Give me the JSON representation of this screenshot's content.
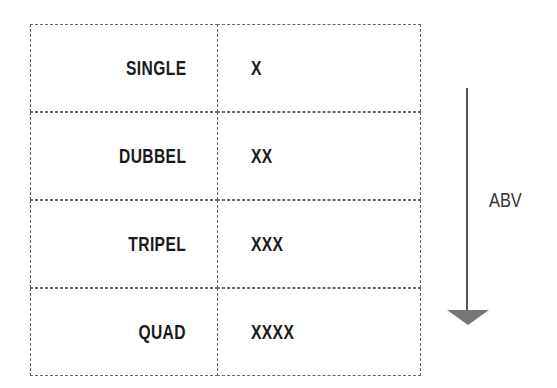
{
  "table": {
    "rows": [
      {
        "style": "SINGLE",
        "marks": "X"
      },
      {
        "style": "DUBBEL",
        "marks": "XX"
      },
      {
        "style": "TRIPEL",
        "marks": "XXX"
      },
      {
        "style": "QUAD",
        "marks": "XXXX"
      }
    ]
  },
  "arrow": {
    "label": "ABV",
    "direction": "down",
    "icon": "arrow-down-icon",
    "color": "#555555"
  }
}
